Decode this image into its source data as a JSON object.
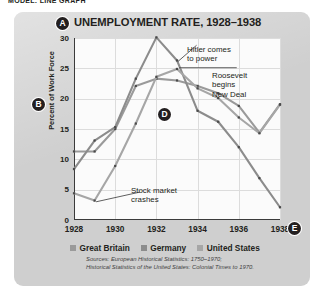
{
  "model_header": "MODEL: LINE GRAPH",
  "callouts": [
    {
      "letter": "A",
      "name": "callout-a-title"
    },
    {
      "letter": "B",
      "name": "callout-b-yaxis"
    },
    {
      "letter": "D",
      "name": "callout-d-plot"
    },
    {
      "letter": "E",
      "name": "callout-e-xaxis"
    }
  ],
  "legend": {
    "items": [
      {
        "label": "Great Britain",
        "color": "#9a9a9a"
      },
      {
        "label": "Germany",
        "color": "#8c8c8c"
      },
      {
        "label": "United States",
        "color": "#a6a6a6"
      }
    ]
  },
  "sources": {
    "line1": "Sources: European Historical Statistics: 1750–1970;",
    "line2": "Historical Statistics of the United States: Colonial Times to 1970."
  },
  "annotations": {
    "hitler_line1": "Hitler comes",
    "hitler_line2": "to power",
    "roosevelt_line1": "Roosevelt",
    "roosevelt_line2": "begins",
    "roosevelt_line3": "New Deal",
    "stock_line1": "Stock market",
    "stock_line2": "crashes"
  },
  "chart_data": {
    "type": "line",
    "title": "UNEMPLOYMENT RATE, 1928–1938",
    "xlabel": "",
    "ylabel": "Percent of Work Force",
    "x": [
      1928,
      1929,
      1930,
      1931,
      1932,
      1933,
      1934,
      1935,
      1936,
      1937,
      1938
    ],
    "xtick_labels": [
      "1928",
      "1930",
      "1932",
      "1934",
      "1936",
      "1938"
    ],
    "xticks": [
      1928,
      1930,
      1932,
      1934,
      1936,
      1938
    ],
    "ytick_labels": [
      "0",
      "5",
      "10",
      "15",
      "20",
      "25",
      "30"
    ],
    "yticks": [
      0,
      5,
      10,
      15,
      20,
      25,
      30
    ],
    "ylim": [
      0,
      30
    ],
    "xlim": [
      1928,
      1938
    ],
    "grid": true,
    "legend_position": "below",
    "series": [
      {
        "name": "Great Britain",
        "color": "#9a9a9a",
        "values": [
          11.3,
          11.3,
          15.0,
          22.1,
          23.3,
          23.0,
          22.1,
          20.9,
          18.8,
          14.4,
          19.1
        ]
      },
      {
        "name": "Germany",
        "color": "#8c8c8c",
        "values": [
          8.4,
          13.1,
          15.3,
          23.3,
          30.1,
          26.3,
          18.0,
          16.2,
          12.0,
          6.9,
          2.1
        ]
      },
      {
        "name": "United States",
        "color": "#a6a6a6",
        "values": [
          4.4,
          3.2,
          8.9,
          15.9,
          23.6,
          24.9,
          21.7,
          20.1,
          16.9,
          14.3,
          19.0
        ]
      }
    ],
    "annotations": [
      {
        "text": "Hitler comes to power",
        "x": 1933,
        "y": 26.3
      },
      {
        "text": "Roosevelt begins New Deal",
        "x": 1933,
        "y": 24.9
      },
      {
        "text": "Stock market crashes",
        "x": 1929,
        "y": 3.2
      }
    ]
  }
}
